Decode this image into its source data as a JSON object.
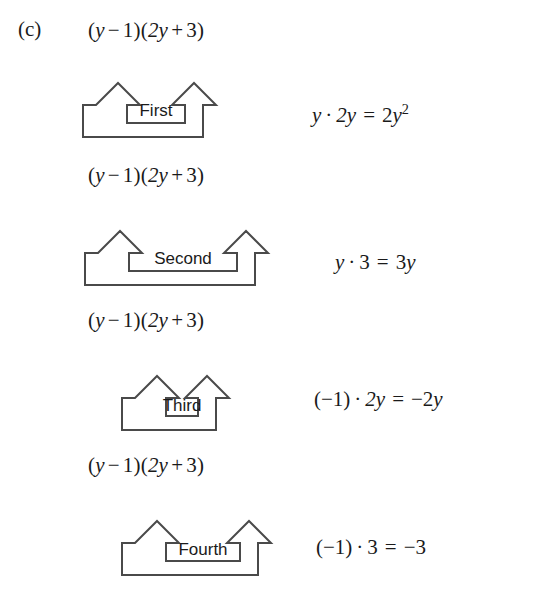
{
  "figure": {
    "part_label": "(c)",
    "expression_text": "(y − 1)(2y + 3)",
    "rows": [
      {
        "order_label": "First",
        "expression": {
          "open_paren": "(",
          "term1": "y",
          "minus": "−",
          "term2": "1",
          "close_paren": ")",
          "open_paren2": "(",
          "term3": "2y",
          "plus": "+",
          "term4": "3",
          "close_paren2": ")"
        },
        "result": {
          "left_factor": "y",
          "dot": "·",
          "right_factor": "2y",
          "equals": "=",
          "product_coefficient": "2",
          "product_variable": "y",
          "product_exponent": "2",
          "full_text": "y · 2y = 2y²"
        }
      },
      {
        "order_label": "Second",
        "expression": {
          "open_paren": "(",
          "term1": "y",
          "minus": "−",
          "term2": "1",
          "close_paren": ")",
          "open_paren2": "(",
          "term3": "2y",
          "plus": "+",
          "term4": "3",
          "close_paren2": ")"
        },
        "result": {
          "left_factor": "y",
          "dot": "·",
          "right_factor": "3",
          "equals": "=",
          "product_coefficient": "3",
          "product_variable": "y",
          "product_exponent": "",
          "full_text": "y · 3 = 3y"
        }
      },
      {
        "order_label": "Third",
        "expression": {
          "open_paren": "(",
          "term1": "y",
          "minus": "−",
          "term2": "1",
          "close_paren": ")",
          "open_paren2": "(",
          "term3": "2y",
          "plus": "+",
          "term4": "3",
          "close_paren2": ")"
        },
        "result": {
          "left_factor": "(−1)",
          "dot": "·",
          "right_factor": "2y",
          "equals": "=",
          "product_coefficient": "−2",
          "product_variable": "y",
          "product_exponent": "",
          "full_text": "(−1) · 2y = −2y"
        }
      },
      {
        "order_label": "Fourth",
        "expression": {
          "open_paren": "(",
          "term1": "y",
          "minus": "−",
          "term2": "1",
          "close_paren": ")",
          "open_paren2": "(",
          "term3": "2y",
          "plus": "+",
          "term4": "3",
          "close_paren2": ")"
        },
        "result": {
          "left_factor": "(−1)",
          "dot": "·",
          "right_factor": "3",
          "equals": "=",
          "product_coefficient": "−3",
          "product_variable": "",
          "product_exponent": "",
          "full_text": "(−1) · 3 = −3"
        }
      }
    ],
    "colors": {
      "stroke": "#4a4a4a",
      "text": "#1a1a1a",
      "background": "#ffffff"
    }
  }
}
